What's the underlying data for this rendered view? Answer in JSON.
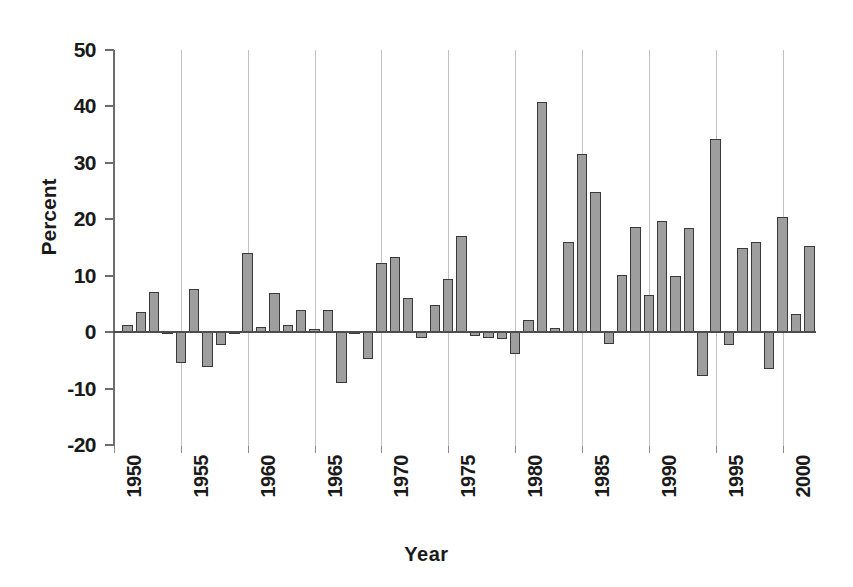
{
  "chart_data": {
    "type": "bar",
    "title": "",
    "xlabel": "Year",
    "ylabel": "Percent",
    "ylim": [
      -20,
      50
    ],
    "xlim": [
      1950,
      2002.5
    ],
    "yticks": [
      50,
      40,
      30,
      20,
      10,
      0,
      -10,
      -20
    ],
    "ytick_labels": [
      "50",
      "40",
      "30",
      "20",
      "10",
      "0",
      "-10",
      "-20"
    ],
    "xticks": [
      1950,
      1955,
      1960,
      1965,
      1970,
      1975,
      1980,
      1985,
      1990,
      1995,
      2000
    ],
    "xtick_labels": [
      "1950",
      "1955",
      "1960",
      "1965",
      "1970",
      "1975",
      "1980",
      "1985",
      "1990",
      "1995",
      "2000"
    ],
    "grid": "vertical-only",
    "legend": "none",
    "bar_color": "#9e9e9e",
    "bar_edge_color": "#3a3a3a",
    "categories": [
      1951,
      1952,
      1953,
      1954,
      1955,
      1956,
      1957,
      1958,
      1959,
      1960,
      1961,
      1962,
      1963,
      1964,
      1965,
      1966,
      1967,
      1968,
      1969,
      1970,
      1971,
      1972,
      1973,
      1974,
      1975,
      1976,
      1977,
      1978,
      1979,
      1980,
      1981,
      1982,
      1983,
      1984,
      1985,
      1986,
      1987,
      1988,
      1989,
      1990,
      1991,
      1992,
      1993,
      1994,
      1995,
      1996,
      1997,
      1998,
      1999,
      2000,
      2001,
      2002
    ],
    "values": [
      1.2,
      3.6,
      7.2,
      -0.3,
      -5.4,
      7.6,
      -6.2,
      -2.2,
      -0.4,
      14.0,
      1.0,
      7.0,
      1.3,
      4.0,
      0.6,
      3.9,
      -9.1,
      -0.4,
      -4.7,
      12.3,
      13.4,
      6.0,
      -1.0,
      4.8,
      9.5,
      17.1,
      -0.6,
      -1.0,
      -1.3,
      -3.8,
      2.1,
      40.8,
      0.8,
      15.9,
      31.5,
      24.8,
      -2.1,
      10.2,
      18.6,
      6.6,
      19.7,
      10.0,
      18.4,
      -7.7,
      34.2,
      -2.2,
      15.0,
      15.9,
      -6.5,
      20.4,
      3.2,
      15.3
    ]
  }
}
